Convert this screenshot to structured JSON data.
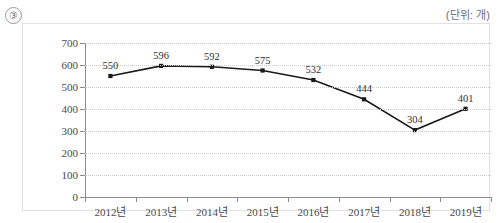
{
  "header": {
    "marker": "③",
    "unit_note": "(단위: 개)"
  },
  "chart_data": {
    "type": "line",
    "title": "",
    "subtitle": "",
    "xlabel": "",
    "ylabel": "",
    "unit": "개",
    "categories": [
      "2012년",
      "2013년",
      "2014년",
      "2015년",
      "2016년",
      "2017년",
      "2018년",
      "2019년"
    ],
    "values": [
      550,
      596,
      592,
      575,
      532,
      444,
      304,
      401
    ],
    "point_labels": [
      "550",
      "596",
      "592",
      "575",
      "532",
      "444",
      "304",
      "401"
    ],
    "ylim": [
      0,
      700
    ],
    "ytick_step": 100,
    "yticks": [
      0,
      100,
      200,
      300,
      400,
      500,
      600,
      700
    ],
    "ytick_labels": [
      "0",
      "100",
      "200",
      "300",
      "400",
      "500",
      "600",
      "700"
    ],
    "grid": true,
    "grid_style": "dotted-horizontal",
    "legend": false,
    "legend_position": "none",
    "line_color": "#1a1a1a",
    "marker_color": "#1a1a1a",
    "marker_shape": "square",
    "axis_color": "#8d8d8d",
    "grid_color": "#c9c9c9"
  }
}
